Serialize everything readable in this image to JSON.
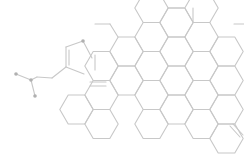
{
  "diagram": {
    "type": "chemical-structure",
    "colors": {
      "background": "#ffffff",
      "bond": "#c8c8c8",
      "atom_dot": "#b0b0b0"
    },
    "hex_side": 16.7,
    "hex_rings": [
      {
        "cx": 151.5,
        "cy": 8
      },
      {
        "cx": 151.5,
        "cy": 37
      },
      {
        "cx": 151.5,
        "cy": 66
      },
      {
        "cx": 151.5,
        "cy": 95
      },
      {
        "cx": 176.5,
        "cy": 22.5
      },
      {
        "cx": 176.5,
        "cy": 51.5
      },
      {
        "cx": 176.5,
        "cy": 80.5
      },
      {
        "cx": 176.5,
        "cy": 109.5
      },
      {
        "cx": 201.5,
        "cy": 8
      },
      {
        "cx": 201.5,
        "cy": 37
      },
      {
        "cx": 201.5,
        "cy": 66
      },
      {
        "cx": 201.5,
        "cy": 95
      },
      {
        "cx": 201.5,
        "cy": 124
      },
      {
        "cx": 226.5,
        "cy": 51.5
      },
      {
        "cx": 226.5,
        "cy": 80.5
      },
      {
        "cx": 226.5,
        "cy": 109.5
      },
      {
        "cx": 226.5,
        "cy": 138.5
      },
      {
        "cx": 126.5,
        "cy": 51.5
      },
      {
        "cx": 126.5,
        "cy": 80.5
      },
      {
        "cx": 151.5,
        "cy": 124
      },
      {
        "cx": 101.5,
        "cy": 66
      },
      {
        "cx": 101.5,
        "cy": 95
      },
      {
        "cx": 101.5,
        "cy": 124
      },
      {
        "cx": 76.5,
        "cy": 109.5
      }
    ],
    "bonds": [
      [
        92,
        58,
        83,
        41
      ],
      [
        83,
        41,
        66,
        47
      ],
      [
        66,
        47,
        66,
        67
      ],
      [
        66,
        67,
        84,
        74
      ],
      [
        69,
        50,
        69,
        65
      ],
      [
        66,
        67,
        52,
        78
      ],
      [
        52,
        78,
        37,
        77
      ],
      [
        37,
        77,
        31,
        80
      ],
      [
        31,
        80,
        16,
        74
      ],
      [
        31,
        80,
        35,
        96
      ],
      [
        95,
        24,
        110,
        24
      ],
      [
        110,
        24,
        118,
        37
      ],
      [
        168,
        8,
        184,
        8
      ],
      [
        193,
        22,
        193,
        8
      ],
      [
        234,
        24,
        244,
        24
      ],
      [
        90,
        82,
        106,
        82
      ],
      [
        90,
        86,
        106,
        86
      ],
      [
        95,
        70,
        95,
        55
      ],
      [
        230,
        126,
        240,
        137
      ],
      [
        233,
        124,
        243,
        135
      ]
    ],
    "atoms": [
      {
        "x": 83,
        "y": 41,
        "label": ""
      },
      {
        "x": 16,
        "y": 74,
        "label": ""
      },
      {
        "x": 35,
        "y": 96,
        "label": ""
      },
      {
        "x": 31,
        "y": 80,
        "label": ""
      }
    ]
  }
}
